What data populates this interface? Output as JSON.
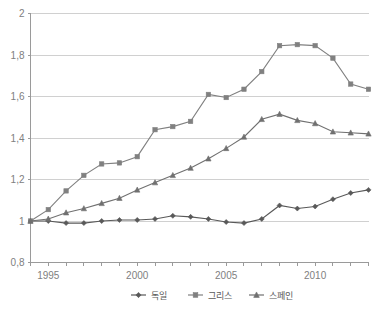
{
  "chart_data": {
    "type": "line",
    "title": "",
    "subtitle": "",
    "xlabel": "",
    "ylabel": "",
    "x": [
      1994,
      1995,
      1996,
      1997,
      1998,
      1999,
      2000,
      2001,
      2002,
      2003,
      2004,
      2005,
      2006,
      2007,
      2008,
      2009,
      2010,
      2011,
      2012,
      2013
    ],
    "xlim": [
      1994,
      2013
    ],
    "ylim": [
      0.8,
      2.0
    ],
    "y_ticks": [
      0.8,
      1.0,
      1.2,
      1.4,
      1.6,
      1.8,
      2.0
    ],
    "y_tick_labels": [
      "0,8",
      "1",
      "1,2",
      "1,4",
      "1,6",
      "1,8",
      "2"
    ],
    "x_ticks": [
      1995,
      2000,
      2005,
      2010
    ],
    "x_tick_labels": [
      "1995",
      "2000",
      "2005",
      "2010"
    ],
    "grid": true,
    "legend_position": "bottom",
    "decimal_separator": ",",
    "series": [
      {
        "name": "독일",
        "marker": "diamond",
        "color": "#595959",
        "values": [
          1.0,
          1.0,
          0.99,
          0.99,
          1.0,
          1.005,
          1.005,
          1.01,
          1.025,
          1.02,
          1.01,
          0.995,
          0.99,
          1.01,
          1.075,
          1.06,
          1.07,
          1.105,
          1.135,
          1.15
        ]
      },
      {
        "name": "그리스",
        "marker": "square",
        "color": "#808080",
        "values": [
          1.0,
          1.055,
          1.145,
          1.22,
          1.275,
          1.28,
          1.31,
          1.44,
          1.455,
          1.48,
          1.61,
          1.595,
          1.635,
          1.72,
          1.845,
          1.85,
          1.845,
          1.785,
          1.66,
          1.635
        ]
      },
      {
        "name": "스페인",
        "marker": "triangle",
        "color": "#707070",
        "values": [
          1.0,
          1.01,
          1.04,
          1.06,
          1.085,
          1.11,
          1.15,
          1.185,
          1.22,
          1.255,
          1.3,
          1.35,
          1.405,
          1.49,
          1.515,
          1.485,
          1.47,
          1.43,
          1.425,
          1.42
        ]
      }
    ]
  },
  "legend": {
    "items": [
      {
        "label": "독일",
        "marker": "diamond",
        "color": "#595959"
      },
      {
        "label": "그리스",
        "marker": "square",
        "color": "#808080"
      },
      {
        "label": "스페인",
        "marker": "triangle",
        "color": "#707070"
      }
    ]
  }
}
